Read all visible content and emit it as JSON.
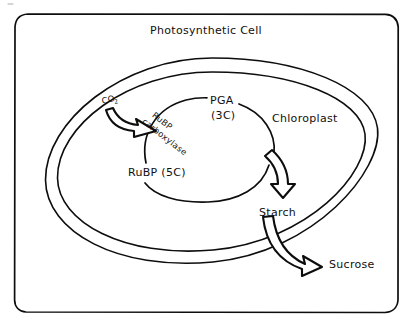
{
  "diagram": {
    "title": "Photosynthetic Cell",
    "labels": {
      "cell": "Photosynthetic Cell",
      "chloroplast": "Chloroplast",
      "co2": "CO",
      "co2_subscript": "2",
      "enzyme_line1": "RuBP",
      "enzyme_line2": "carboxylase",
      "pga_line1": "PGA",
      "pga_line2": "(3C)",
      "rubp": "RuBP (5C)",
      "starch": "Starch",
      "sucrose": "Sucrose"
    },
    "colors": {
      "ink": "#0d0d0d",
      "paper": "#ffffff"
    }
  }
}
